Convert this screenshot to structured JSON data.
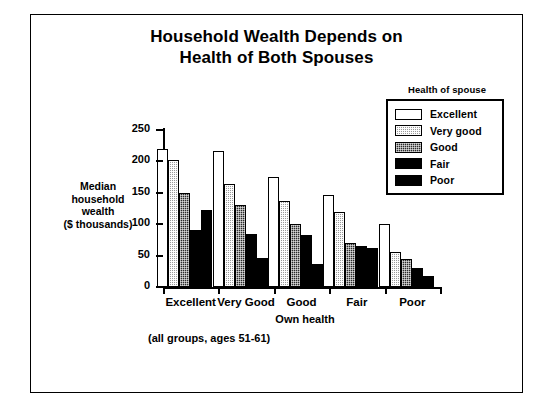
{
  "chart_data": {
    "type": "bar",
    "title": "Household Wealth Depends on Health of Both Spouses",
    "title_lines": [
      "Household Wealth Depends on",
      "Health of Both Spouses"
    ],
    "xlabel": "Own health",
    "ylabel": "Median household wealth ($ thousands)",
    "ylabel_lines": [
      "Median",
      "household",
      "wealth",
      "($ thousands)"
    ],
    "note": "(all groups, ages 51-61)",
    "legend_title": "Health of spouse",
    "legend_position": "top-right",
    "grid": false,
    "ylim": [
      0,
      250
    ],
    "yticks": [
      0,
      50,
      100,
      150,
      200,
      250
    ],
    "ytick_labels": [
      "0",
      "50",
      "100",
      "150",
      "200",
      "250"
    ],
    "categories": [
      "Excellent",
      "Very Good",
      "Good",
      "Fair",
      "Poor"
    ],
    "series": [
      {
        "name": "Excellent",
        "fill": "f-excellent",
        "color": "#ffffff",
        "values": [
          220,
          217,
          175,
          147,
          100
        ]
      },
      {
        "name": "Very good",
        "fill": "f-verygood",
        "color": "#9a9a9a",
        "values": [
          202,
          164,
          137,
          120,
          56
        ]
      },
      {
        "name": "Good",
        "fill": "f-good",
        "color": "#2b2b2b",
        "values": [
          150,
          131,
          100,
          70,
          45
        ]
      },
      {
        "name": "Fair",
        "fill": "f-fair",
        "color": "#000000",
        "values": [
          91,
          85,
          83,
          66,
          30
        ]
      },
      {
        "name": "Poor",
        "fill": "f-poor",
        "color": "#000000",
        "values": [
          122,
          46,
          37,
          62,
          18
        ]
      }
    ]
  }
}
